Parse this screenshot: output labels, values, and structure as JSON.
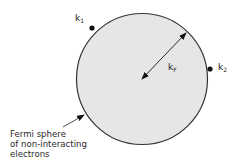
{
  "diagram": {
    "colors": {
      "sphere_fill": "#e6e6e6",
      "sphere_stroke": "#333333",
      "ink": "#111111",
      "background": "#ffffff"
    },
    "sphere": {
      "cx": 142,
      "cy": 79,
      "r": 65.5
    },
    "radius_arrow": {
      "from": [
        142,
        79
      ],
      "to": [
        186,
        33
      ],
      "label_main": "k",
      "label_sub": "F"
    },
    "points": [
      {
        "id": "k1",
        "label_main": "k",
        "label_sub": "1",
        "x": 92,
        "y": 28
      },
      {
        "id": "k2",
        "label_main": "k",
        "label_sub": "2",
        "x": 210,
        "y": 69
      }
    ],
    "pointer_arrow": {
      "from": [
        63,
        127
      ],
      "to": [
        84,
        115
      ]
    },
    "caption": {
      "line1": "Fermi sphere",
      "line2": "of non-interacting",
      "line3": "electrons"
    }
  }
}
